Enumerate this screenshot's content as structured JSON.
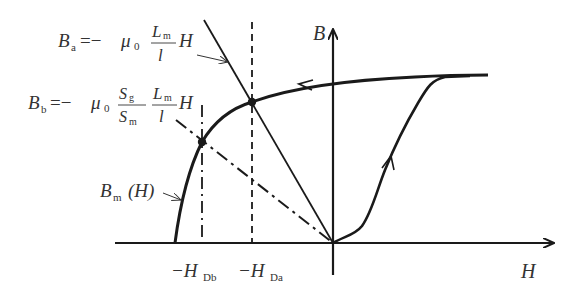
{
  "diagram": {
    "type": "B-H magnetization curve with load lines",
    "axes": {
      "x_label": "H",
      "y_label": "B"
    },
    "equations": {
      "Ba": {
        "lhs": "B",
        "lhs_sub": "a",
        "eq": "=−",
        "mu": "μ",
        "mu_sub": "0",
        "frac_num": "L",
        "frac_num_sub": "m",
        "frac_den": "l",
        "tail": "H"
      },
      "Bb": {
        "lhs": "B",
        "lhs_sub": "b",
        "eq": "=−",
        "mu": "μ",
        "mu_sub": "0",
        "frac1_num": "S",
        "frac1_num_sub": "g",
        "frac1_den": "S",
        "frac1_den_sub": "m",
        "frac2_num": "L",
        "frac2_num_sub": "m",
        "frac2_den": "l",
        "tail": "H"
      },
      "Bm": {
        "lhs": "B",
        "lhs_sub": "m",
        "arg": "(H)"
      }
    },
    "ticks": {
      "HDb": {
        "prefix": "−H",
        "sub": "Db"
      },
      "HDa": {
        "prefix": "−H",
        "sub": "Da"
      }
    },
    "colors": {
      "line": "#1a1a1a",
      "text": "#333333",
      "background": "#ffffff"
    }
  }
}
